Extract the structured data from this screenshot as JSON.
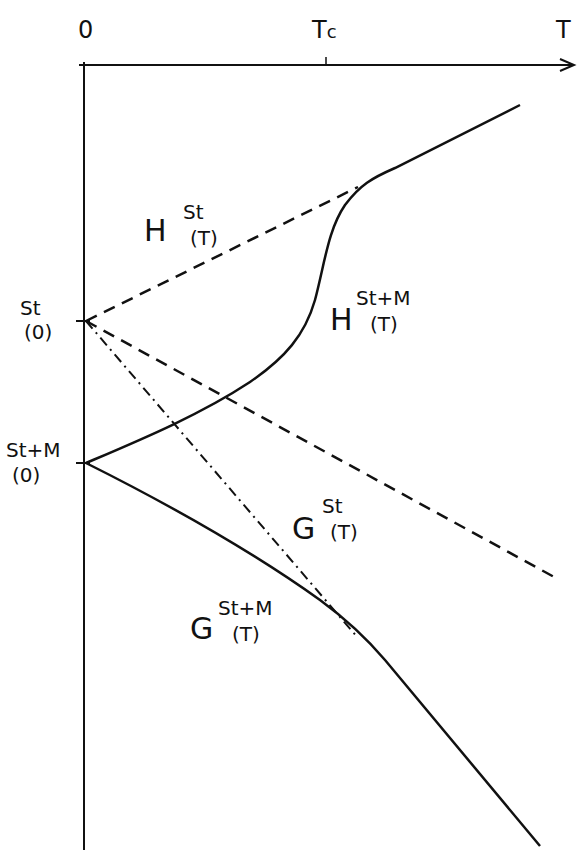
{
  "axes": {
    "x_label": "T",
    "origin_label": "0",
    "tc_label": "T",
    "tc_sub": "c"
  },
  "y_points": {
    "st0_top": "St",
    "st0_bottom": "(0)",
    "stm0_top": "St+M",
    "stm0_bottom": "(0)"
  },
  "curves": {
    "h_st": {
      "main": "H",
      "sup": "St",
      "sub": "(T)",
      "style": "dashed"
    },
    "h_stm": {
      "main": "H",
      "sup": "St+M",
      "sub": "(T)",
      "style": "solid"
    },
    "g_st": {
      "main": "G",
      "sup": "St",
      "sub": "(T)",
      "style": "dashed"
    },
    "g_stm": {
      "main": "G",
      "sup": "St+M",
      "sub": "(T)",
      "style": "solid"
    },
    "tangent": {
      "style": "dash-dot"
    }
  },
  "colors": {
    "ink": "#111111",
    "background": "#ffffff"
  }
}
